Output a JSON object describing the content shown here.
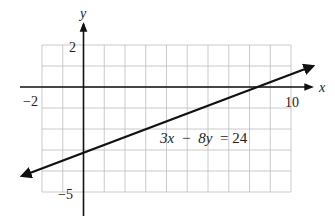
{
  "chart_data": {
    "type": "line",
    "title": "",
    "equation": "3x − 8y = 24",
    "xlabel": "x",
    "ylabel": "y",
    "xlim": [
      -2,
      10
    ],
    "ylim": [
      -5,
      2
    ],
    "grid": true,
    "grid_step": 1,
    "x_tick_labels": [
      {
        "value": -2,
        "label": "−2"
      },
      {
        "value": 10,
        "label": "10"
      }
    ],
    "y_tick_labels": [
      {
        "value": 2,
        "label": "2"
      },
      {
        "value": -5,
        "label": "−5"
      }
    ],
    "series": [
      {
        "name": "3x − 8y = 24",
        "slope": 0.375,
        "intercept": -3,
        "points": [
          {
            "x": -3,
            "y": -4.125
          },
          {
            "x": 0,
            "y": -3
          },
          {
            "x": 8,
            "y": 0
          },
          {
            "x": 11,
            "y": 1.125
          }
        ],
        "arrows": "both"
      }
    ],
    "annotations": [
      {
        "text": "3x − 8y = 24",
        "x": 4,
        "y": -2.6
      }
    ]
  },
  "labels": {
    "x_axis": "x",
    "y_axis": "y",
    "x_min": "−2",
    "x_max": "10",
    "y_max": "2",
    "y_min": "−5",
    "eq_3x": "3x",
    "eq_minus": "−",
    "eq_8y": "8y",
    "eq_rest": "= 24"
  }
}
